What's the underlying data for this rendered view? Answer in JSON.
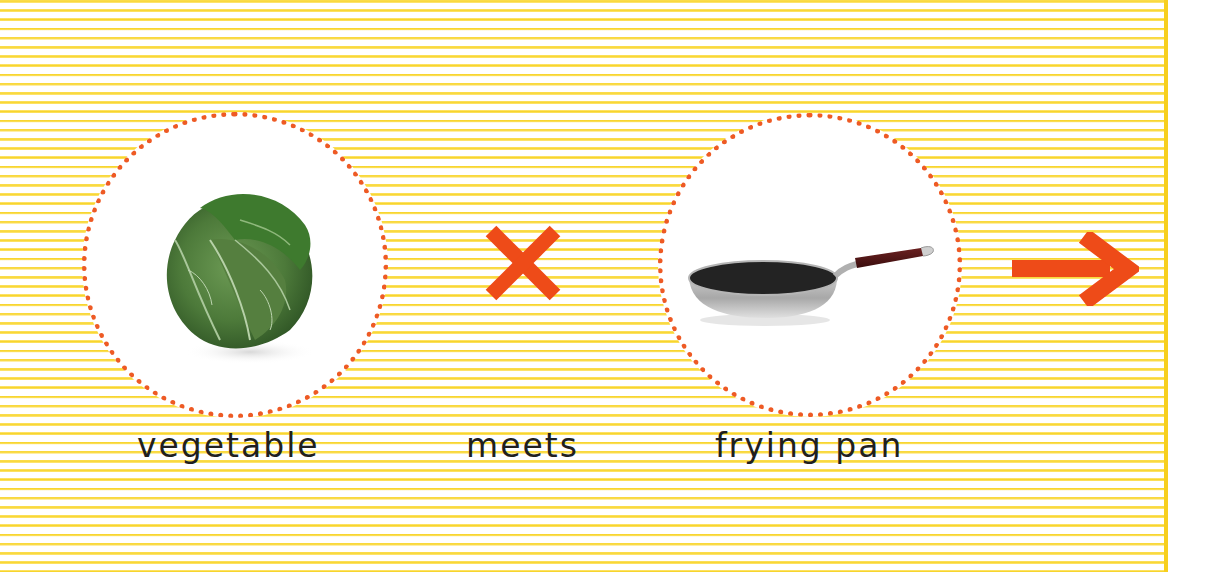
{
  "equation": {
    "items": [
      {
        "id": "vegetable",
        "label": "vegetable",
        "image": "cabbage"
      },
      {
        "id": "operator",
        "label": "meets",
        "icon": "times-icon"
      },
      {
        "id": "frying_pan",
        "label": "frying pan",
        "image": "frying-pan"
      }
    ],
    "result_icon": "arrow-right-icon"
  },
  "colors": {
    "stripe_yellow": "#f7d42a",
    "background": "#ffffff",
    "accent_orange": "#ee5a24",
    "dot_orange": "#ee5a24",
    "text": "#1f1f1f"
  }
}
